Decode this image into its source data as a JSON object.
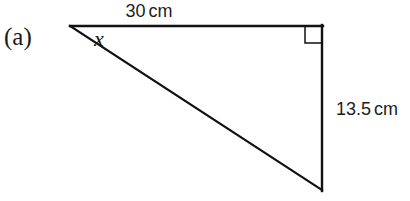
{
  "figure": {
    "part_label": "(a)",
    "angle_label": "x",
    "shape": "right-triangle",
    "labels": {
      "top_side_value": "30",
      "top_side_unit": "cm",
      "right_side_value": "13.5",
      "right_side_unit": "cm"
    },
    "geometry": {
      "apex": [
        70,
        26
      ],
      "top_right": [
        322,
        26
      ],
      "bottom_right": [
        322,
        190
      ],
      "right_angle_marker_size": 17,
      "stroke_color": "#111111",
      "stroke_width": 2.2
    }
  }
}
